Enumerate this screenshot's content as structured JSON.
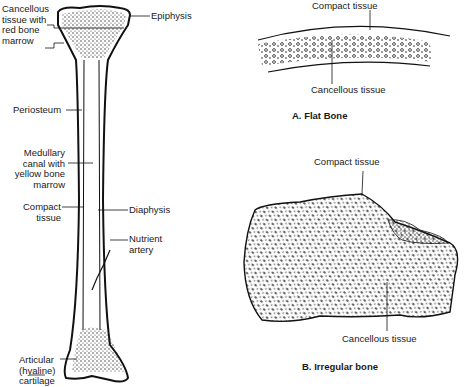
{
  "long_bone": {
    "labels": {
      "cancellous": "Cancellous\ntissue with\nred bone\nmarrow",
      "epiphysis": "Epiphysis",
      "periosteum": "Periosteum",
      "medullary": "Medullary\ncanal with\nyellow bone\nmarrow",
      "compact": "Compact\ntissue",
      "diaphysis": "Diaphysis",
      "nutrient": "Nutrient\nartery",
      "articular": "Articular\n(hyaline)\ncartilage"
    }
  },
  "flat_bone": {
    "compact_label": "Compact tissue",
    "cancellous_label": "Cancellous tissue",
    "caption": "A. Flat Bone"
  },
  "irregular_bone": {
    "compact_label": "Compact tissue",
    "cancellous_label": "Cancellous tissue",
    "caption": "B. Irregular bone"
  }
}
